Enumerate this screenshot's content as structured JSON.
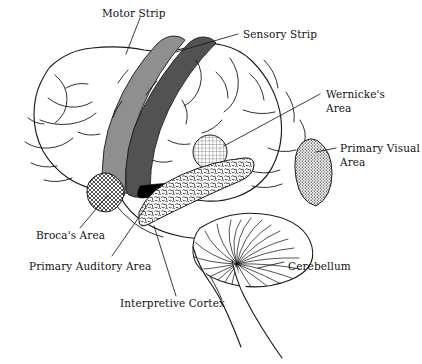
{
  "figure": {
    "width": 422,
    "height": 364,
    "background_color": "#ffffff",
    "line_color": "#1a1a1a",
    "text_color": "#111111"
  },
  "labels": {
    "motor_strip": "Motor Strip",
    "sensory_strip": "Sensory Strip",
    "wernickes_area_line1": "Wernicke's",
    "wernickes_area_line2": "Area",
    "primary_visual_area_line1": "Primary Visual",
    "primary_visual_area_line2": "Area",
    "brocas_area": "Broca's Area",
    "primary_auditory_area": "Primary Auditory Area",
    "interpretive_cortex": "Interpretive Cortex",
    "cerebellum": "Cerebellum"
  },
  "regions": [
    {
      "key": "motor_strip",
      "name": "Motor Strip",
      "fill_color": "#8f8f8f",
      "texture": "solid-light-gray",
      "shape": "vertical band anterior to central sulcus"
    },
    {
      "key": "sensory_strip",
      "name": "Sensory Strip",
      "fill_color": "#525252",
      "texture": "solid-dark-gray",
      "shape": "vertical band posterior to central sulcus"
    },
    {
      "key": "wernickes_area",
      "name": "Wernicke's Area",
      "fill_color": "#ffffff",
      "texture": "fine-grid",
      "shape": "circle on posterior superior temporal region"
    },
    {
      "key": "primary_visual_area",
      "name": "Primary Visual Area",
      "fill_color": "#ffffff",
      "texture": "dense-stipple",
      "shape": "leaf shape at occipital pole"
    },
    {
      "key": "brocas_area",
      "name": "Broca's Area",
      "fill_color": "#ffffff",
      "texture": "crosshatch-mesh",
      "shape": "oval on inferior frontal gyrus"
    },
    {
      "key": "primary_auditory_area",
      "name": "Primary Auditory Area",
      "fill_color": "#ffffff",
      "texture": "squiggle-stipple",
      "shape": "elongated band along superior temporal gyrus"
    },
    {
      "key": "interpretive_cortex",
      "name": "Interpretive Cortex",
      "fill_color": "#ffffff",
      "texture": "none",
      "shape": "temporal lobe region indicated by leader line"
    },
    {
      "key": "cerebellum",
      "name": "Cerebellum",
      "fill_color": "#ffffff",
      "texture": "radiating-folia-lines",
      "shape": "fan-shaped structure posterior-inferior"
    },
    {
      "key": "lateral_fissure",
      "name": "Lateral Fissure",
      "fill_color": "#000000",
      "texture": "solid-black",
      "shape": "black wedge between frontal and temporal lobes"
    },
    {
      "key": "brainstem",
      "name": "Brainstem",
      "fill_color": "#ffffff",
      "texture": "none",
      "shape": "tapering stalk descending below cerebrum"
    }
  ]
}
